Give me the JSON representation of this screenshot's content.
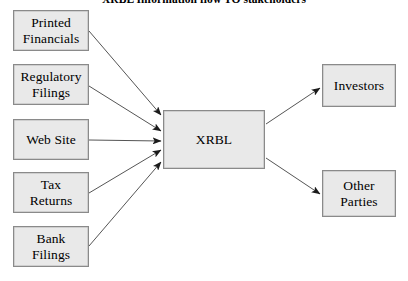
{
  "title": "XRBL Information flow TO stakeholders",
  "canvas": {
    "width": 408,
    "height": 281
  },
  "colors": {
    "box_fill": "#e9e9e9",
    "box_border": "#8a8a8a",
    "arrow": "#555555",
    "text": "#000000",
    "background": "#ffffff"
  },
  "nodes": {
    "sources": [
      {
        "id": "printed-financials",
        "label": "Printed\nFinancials",
        "x": 13,
        "y": 10,
        "w": 76,
        "h": 41
      },
      {
        "id": "regulatory-filings",
        "label": "Regulatory\nFilings",
        "x": 13,
        "y": 64,
        "w": 76,
        "h": 41
      },
      {
        "id": "web-site",
        "label": "Web Site",
        "x": 13,
        "y": 119,
        "w": 76,
        "h": 41
      },
      {
        "id": "tax-returns",
        "label": "Tax\nReturns",
        "x": 13,
        "y": 172,
        "w": 76,
        "h": 41
      },
      {
        "id": "bank-filings",
        "label": "Bank\nFilings",
        "x": 13,
        "y": 226,
        "w": 76,
        "h": 41
      }
    ],
    "hub": {
      "id": "xrbl",
      "label": "XRBL",
      "x": 163,
      "y": 110,
      "w": 102,
      "h": 59
    },
    "targets": [
      {
        "id": "investors",
        "label": "Investors",
        "x": 322,
        "y": 64,
        "w": 74,
        "h": 43
      },
      {
        "id": "other-parties",
        "label": "Other\nParties",
        "x": 322,
        "y": 170,
        "w": 74,
        "h": 47
      }
    ]
  },
  "edges": {
    "inbound": [
      {
        "id": "edge-printed-financials-to-xrbl",
        "x1": 89,
        "y1": 31,
        "x2": 161,
        "y2": 115
      },
      {
        "id": "edge-regulatory-filings-to-xrbl",
        "x1": 89,
        "y1": 86,
        "x2": 161,
        "y2": 131
      },
      {
        "id": "edge-web-site-to-xrbl",
        "x1": 89,
        "y1": 140,
        "x2": 161,
        "y2": 141
      },
      {
        "id": "edge-tax-returns-to-xrbl",
        "x1": 89,
        "y1": 193,
        "x2": 161,
        "y2": 150
      },
      {
        "id": "edge-bank-filings-to-xrbl",
        "x1": 89,
        "y1": 246,
        "x2": 161,
        "y2": 162
      }
    ],
    "outbound": [
      {
        "id": "edge-xrbl-to-investors",
        "x1": 266,
        "y1": 124,
        "x2": 320,
        "y2": 88
      },
      {
        "id": "edge-xrbl-to-other-parties",
        "x1": 266,
        "y1": 158,
        "x2": 320,
        "y2": 194
      }
    ]
  }
}
